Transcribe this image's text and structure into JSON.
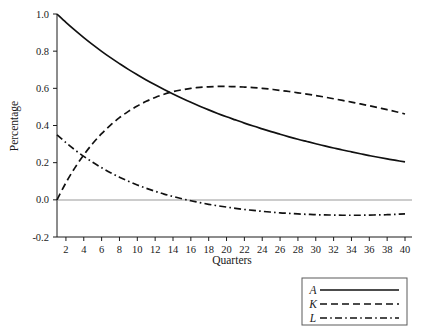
{
  "chart_data": {
    "type": "line",
    "title": "",
    "xlabel": "Quarters",
    "ylabel": "Percentage",
    "xlim": [
      1,
      40
    ],
    "ylim": [
      -0.2,
      1.0
    ],
    "grid": false,
    "legend_position": "bottom-right",
    "zero_reference_line": true,
    "xticks": [
      2,
      4,
      6,
      8,
      10,
      12,
      14,
      16,
      18,
      20,
      22,
      24,
      26,
      28,
      30,
      32,
      34,
      36,
      38,
      40
    ],
    "xtick_labels": [
      "2",
      "4",
      "6",
      "8",
      "10",
      "12",
      "14",
      "16",
      "18",
      "20",
      "22",
      "24",
      "26",
      "28",
      "30",
      "32",
      "34",
      "36",
      "38",
      "40"
    ],
    "yticks": [
      -0.2,
      0.0,
      0.2,
      0.4,
      0.6,
      0.8,
      1.0
    ],
    "ytick_labels": [
      "-0.2",
      "0.0",
      "0.2",
      "0.4",
      "0.6",
      "0.8",
      "1.0"
    ],
    "x": [
      1,
      2,
      3,
      4,
      5,
      6,
      7,
      8,
      9,
      10,
      11,
      12,
      13,
      14,
      15,
      16,
      17,
      18,
      19,
      20,
      21,
      22,
      23,
      24,
      25,
      26,
      27,
      28,
      29,
      30,
      31,
      32,
      33,
      34,
      35,
      36,
      37,
      38,
      39,
      40
    ],
    "series": [
      {
        "name": "A",
        "style": "solid",
        "color": "#111111",
        "values": [
          1.0,
          0.955,
          0.913,
          0.873,
          0.835,
          0.799,
          0.765,
          0.733,
          0.702,
          0.673,
          0.645,
          0.619,
          0.594,
          0.57,
          0.547,
          0.525,
          0.504,
          0.484,
          0.465,
          0.447,
          0.43,
          0.413,
          0.397,
          0.382,
          0.367,
          0.353,
          0.339,
          0.326,
          0.314,
          0.302,
          0.29,
          0.279,
          0.268,
          0.258,
          0.248,
          0.238,
          0.229,
          0.22,
          0.212,
          0.204
        ]
      },
      {
        "name": "K",
        "style": "dashed",
        "color": "#111111",
        "values": [
          0.0,
          0.092,
          0.172,
          0.242,
          0.303,
          0.356,
          0.402,
          0.442,
          0.476,
          0.505,
          0.53,
          0.551,
          0.568,
          0.582,
          0.592,
          0.6,
          0.605,
          0.608,
          0.61,
          0.61,
          0.609,
          0.607,
          0.604,
          0.6,
          0.595,
          0.589,
          0.583,
          0.576,
          0.569,
          0.561,
          0.553,
          0.544,
          0.535,
          0.526,
          0.516,
          0.506,
          0.496,
          0.485,
          0.474,
          0.462
        ]
      },
      {
        "name": "L",
        "style": "dashdot",
        "color": "#111111",
        "values": [
          0.35,
          0.308,
          0.269,
          0.234,
          0.202,
          0.173,
          0.146,
          0.122,
          0.1,
          0.08,
          0.062,
          0.046,
          0.031,
          0.018,
          0.006,
          -0.005,
          -0.015,
          -0.024,
          -0.032,
          -0.039,
          -0.046,
          -0.052,
          -0.057,
          -0.062,
          -0.066,
          -0.07,
          -0.073,
          -0.076,
          -0.078,
          -0.08,
          -0.081,
          -0.082,
          -0.083,
          -0.083,
          -0.083,
          -0.082,
          -0.081,
          -0.08,
          -0.078,
          -0.076
        ]
      }
    ],
    "annotations": {
      "a_k_crossover_quarter": 13,
      "a_k_crossover_value": 0.55,
      "k_l_crossover_quarter": 4,
      "l_zero_crossing_quarter": 15,
      "k_peak_quarter": 20,
      "k_peak_value": 0.61
    }
  },
  "legend": {
    "items": [
      {
        "label": "A",
        "style": "solid"
      },
      {
        "label": "K",
        "style": "dashed"
      },
      {
        "label": "L",
        "style": "dashdot"
      }
    ]
  }
}
